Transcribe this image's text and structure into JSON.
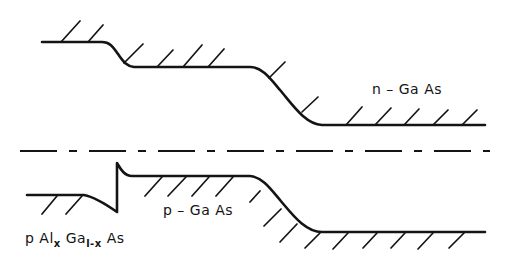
{
  "diagram": {
    "type": "energy-band-diagram",
    "labels": {
      "n_region": "n – Ga As",
      "p_region": "p – Ga As",
      "alga_prefix": "p Al",
      "alga_sub_x": "x",
      "alga_ga": " Ga",
      "alga_sub_1x": "l-x",
      "alga_as": " As"
    },
    "curves": {
      "conduction_band": "upper band edge with hatching above",
      "fermi_level": "dash-dot line",
      "valence_band": "lower band edge with hatching below, spike at heterointerface"
    },
    "colors": {
      "ink": "#141414",
      "background": "#ffffff"
    }
  }
}
